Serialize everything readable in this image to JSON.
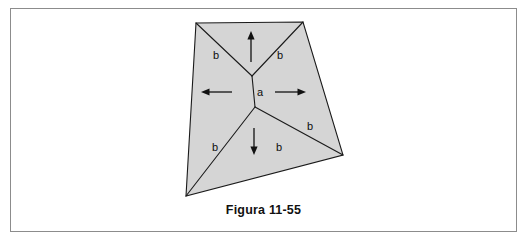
{
  "figure": {
    "caption": "Figura 11-55",
    "frame": {
      "border_color": "#8c8c8c",
      "background": "#ffffff"
    },
    "shape": {
      "name": "irregular-quadrilateral",
      "fill_color": "#d5d5d5",
      "stroke_color": "#1a1a1a",
      "outer_vertices": [
        {
          "name": "top-left",
          "x": 196,
          "y": 23
        },
        {
          "name": "top-right",
          "x": 303,
          "y": 22
        },
        {
          "name": "right",
          "x": 343,
          "y": 155
        },
        {
          "name": "bottom-left",
          "x": 186,
          "y": 196
        }
      ],
      "junctions": [
        {
          "name": "upper-junction",
          "x": 252,
          "y": 76
        },
        {
          "name": "lower-junction",
          "x": 255,
          "y": 107
        }
      ]
    },
    "labels": [
      {
        "id": "label-b-upper-left",
        "text": "b",
        "x": 216,
        "y": 59
      },
      {
        "id": "label-b-upper-right",
        "text": "b",
        "x": 280,
        "y": 59
      },
      {
        "id": "label-a-center",
        "text": "a",
        "x": 260,
        "y": 96
      },
      {
        "id": "label-b-lower-left",
        "text": "b",
        "x": 214,
        "y": 151
      },
      {
        "id": "label-b-lower-middle",
        "text": "b",
        "x": 279,
        "y": 151
      },
      {
        "id": "label-b-lower-right",
        "text": "b",
        "x": 310,
        "y": 130
      }
    ],
    "arrows": [
      {
        "id": "arrow-up",
        "direction": "up",
        "x1": 251,
        "y1": 62,
        "x2": 251,
        "y2": 33
      },
      {
        "id": "arrow-left",
        "direction": "left",
        "x1": 232,
        "y1": 92,
        "x2": 203,
        "y2": 92
      },
      {
        "id": "arrow-right",
        "direction": "right",
        "x1": 275,
        "y1": 92,
        "x2": 304,
        "y2": 92
      },
      {
        "id": "arrow-down",
        "direction": "down",
        "x1": 254,
        "y1": 128,
        "x2": 254,
        "y2": 154
      }
    ]
  }
}
